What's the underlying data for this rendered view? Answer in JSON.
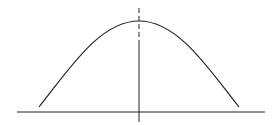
{
  "diagram": {
    "type": "bell-curve",
    "colors": {
      "stroke": "#222222",
      "background": "#ffffff"
    },
    "axis": {
      "x1": 17,
      "x2": 265,
      "y": 112
    },
    "symmetry_line": {
      "x": 139,
      "dashed_from": 8,
      "dashed_to": 45,
      "solid_to": 122
    },
    "curve": {
      "left": [
        39,
        107
      ],
      "peak": [
        139,
        21
      ],
      "right": [
        239,
        107
      ]
    }
  }
}
